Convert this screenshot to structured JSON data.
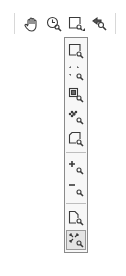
{
  "toolbar": {
    "buttons": [
      {
        "name": "pan-tool",
        "icon": "hand-icon"
      },
      {
        "name": "zoom-history",
        "icon": "clock-zoom-icon"
      },
      {
        "name": "zoom-rectangle",
        "icon": "rectangle-zoom-icon",
        "has_dropdown": true
      },
      {
        "name": "zoom-previous",
        "icon": "back-zoom-icon"
      }
    ]
  },
  "dropdown": {
    "items": [
      {
        "name": "zoom-window",
        "icon": "window-zoom-icon"
      },
      {
        "name": "zoom-dynamic",
        "icon": "dotted-zoom-icon"
      },
      {
        "name": "zoom-scale",
        "icon": "scale-zoom-icon"
      },
      {
        "name": "zoom-center",
        "icon": "center-zoom-icon"
      },
      {
        "name": "zoom-object",
        "icon": "object-zoom-icon"
      },
      {
        "name": "zoom-in",
        "icon": "zoom-in-icon"
      },
      {
        "name": "zoom-out",
        "icon": "zoom-out-icon"
      },
      {
        "name": "zoom-all",
        "icon": "page-zoom-icon"
      },
      {
        "name": "zoom-extents",
        "icon": "extents-zoom-icon",
        "selected": true
      }
    ]
  },
  "colors": {
    "icon": "#3a3a3a",
    "panel_border": "#8a8a8a",
    "panel_bg": "#f7f7f7"
  }
}
